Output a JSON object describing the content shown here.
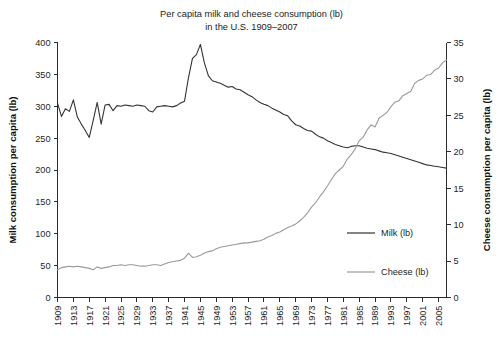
{
  "chart_data": {
    "type": "line",
    "title": "Per capita milk and cheese consumption (lb)",
    "subtitle": "in the U.S. 1909–2007",
    "title_line1": "Per capita milk and cheese consumption (lb)",
    "title_line2": "in the U.S. 1909–2007",
    "xlabel": "",
    "ylabel": "Milk consumption per capita (lb)",
    "y2label": "Cheese consumption per capita (lb)",
    "ylim": [
      0,
      400
    ],
    "y2lim": [
      0,
      35
    ],
    "xlim": [
      1909,
      2007
    ],
    "yticks": [
      0,
      50,
      100,
      150,
      200,
      250,
      300,
      350,
      400
    ],
    "y2ticks": [
      0,
      5,
      10,
      15,
      20,
      25,
      30,
      35
    ],
    "xticks": [
      1909,
      1913,
      1917,
      1921,
      1925,
      1929,
      1933,
      1937,
      1941,
      1945,
      1949,
      1953,
      1957,
      1961,
      1965,
      1969,
      1973,
      1977,
      1981,
      1985,
      1989,
      1993,
      1997,
      2001,
      2005
    ],
    "grid": false,
    "legend_position": "center-right",
    "colors": {
      "milk": "#333333",
      "cheese": "#9a9a9a",
      "axis": "#2b2b2b",
      "background": "#ffffff"
    },
    "x": [
      1909,
      1910,
      1911,
      1912,
      1913,
      1914,
      1915,
      1916,
      1917,
      1918,
      1919,
      1920,
      1921,
      1922,
      1923,
      1924,
      1925,
      1926,
      1927,
      1928,
      1929,
      1930,
      1931,
      1932,
      1933,
      1934,
      1935,
      1936,
      1937,
      1938,
      1939,
      1940,
      1941,
      1942,
      1943,
      1944,
      1945,
      1946,
      1947,
      1948,
      1949,
      1950,
      1951,
      1952,
      1953,
      1954,
      1955,
      1956,
      1957,
      1958,
      1959,
      1960,
      1961,
      1962,
      1963,
      1964,
      1965,
      1966,
      1967,
      1968,
      1969,
      1970,
      1971,
      1972,
      1973,
      1974,
      1975,
      1976,
      1977,
      1978,
      1979,
      1980,
      1981,
      1982,
      1983,
      1984,
      1985,
      1986,
      1987,
      1988,
      1989,
      1990,
      1991,
      1992,
      1993,
      1994,
      1995,
      1996,
      1997,
      1998,
      1999,
      2000,
      2001,
      2002,
      2003,
      2004,
      2005,
      2006,
      2007
    ],
    "series": [
      {
        "name": "Milk (lb)",
        "axis": "left",
        "color": "#333333",
        "values": [
          305,
          284,
          296,
          292,
          310,
          283,
          272,
          262,
          251,
          278,
          306,
          272,
          302,
          303,
          293,
          301,
          300,
          302,
          301,
          300,
          302,
          301,
          300,
          293,
          291,
          299,
          300,
          301,
          300,
          299,
          301,
          305,
          308,
          345,
          375,
          381,
          397,
          368,
          348,
          340,
          338,
          336,
          333,
          330,
          331,
          327,
          326,
          322,
          318,
          315,
          310,
          306,
          303,
          301,
          297,
          294,
          291,
          287,
          285,
          277,
          271,
          269,
          265,
          262,
          261,
          256,
          252,
          250,
          246,
          243,
          240,
          238,
          236,
          235,
          237,
          238,
          238,
          236,
          234,
          233,
          232,
          230,
          228,
          227,
          226,
          224,
          222,
          220,
          218,
          216,
          214,
          212,
          210,
          208,
          207,
          206,
          205,
          204,
          203
        ]
      },
      {
        "name": "Cheese (lb)",
        "axis": "right",
        "color": "#9a9a9a",
        "values": [
          3.8,
          4.1,
          4.2,
          4.3,
          4.2,
          4.3,
          4.2,
          4.1,
          4.0,
          3.8,
          4.2,
          4.0,
          4.1,
          4.2,
          4.4,
          4.4,
          4.5,
          4.4,
          4.5,
          4.5,
          4.4,
          4.3,
          4.3,
          4.4,
          4.5,
          4.5,
          4.4,
          4.6,
          4.8,
          4.9,
          5.0,
          5.1,
          5.4,
          6.1,
          5.5,
          5.6,
          5.8,
          6.1,
          6.3,
          6.4,
          6.7,
          6.9,
          7.0,
          7.1,
          7.2,
          7.3,
          7.4,
          7.5,
          7.5,
          7.6,
          7.7,
          7.8,
          8.0,
          8.3,
          8.5,
          8.8,
          9.0,
          9.3,
          9.6,
          9.8,
          10.1,
          10.5,
          11.0,
          11.6,
          12.4,
          13.0,
          13.8,
          14.5,
          15.3,
          16.2,
          17.0,
          17.5,
          18.0,
          19.0,
          19.6,
          20.4,
          21.5,
          22.0,
          23.0,
          23.7,
          23.4,
          24.6,
          25.0,
          25.4,
          26.2,
          26.8,
          27.0,
          27.7,
          28.0,
          28.3,
          29.4,
          29.8,
          30.0,
          30.5,
          30.6,
          31.2,
          31.5,
          32.2,
          32.6
        ]
      }
    ]
  },
  "legend": {
    "items": [
      {
        "label": "Milk (lb)",
        "color": "#333333"
      },
      {
        "label": "Cheese (lb)",
        "color": "#9a9a9a"
      }
    ]
  }
}
